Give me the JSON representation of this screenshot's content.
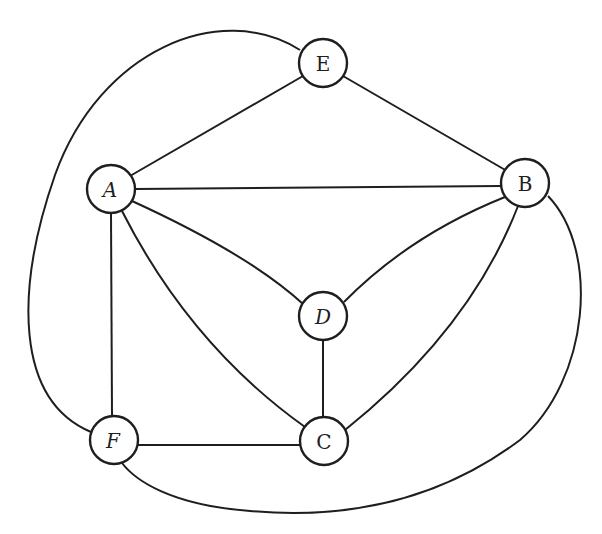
{
  "diagram": {
    "type": "undirected-graph",
    "nodes": [
      {
        "id": "E",
        "label": "E",
        "x": 323,
        "y": 63
      },
      {
        "id": "A",
        "label": "A",
        "x": 111,
        "y": 189
      },
      {
        "id": "B",
        "label": "B",
        "x": 525,
        "y": 183
      },
      {
        "id": "D",
        "label": "D",
        "x": 323,
        "y": 316
      },
      {
        "id": "F",
        "label": "F",
        "x": 114,
        "y": 440
      },
      {
        "id": "C",
        "label": "C",
        "x": 324,
        "y": 441
      }
    ],
    "edges": [
      {
        "from": "E",
        "to": "A"
      },
      {
        "from": "E",
        "to": "B"
      },
      {
        "from": "A",
        "to": "B"
      },
      {
        "from": "A",
        "to": "D"
      },
      {
        "from": "A",
        "to": "C"
      },
      {
        "from": "A",
        "to": "F"
      },
      {
        "from": "B",
        "to": "D"
      },
      {
        "from": "B",
        "to": "C"
      },
      {
        "from": "D",
        "to": "C"
      },
      {
        "from": "F",
        "to": "C"
      },
      {
        "from": "E",
        "to": "F"
      },
      {
        "from": "B",
        "to": "F"
      }
    ]
  }
}
